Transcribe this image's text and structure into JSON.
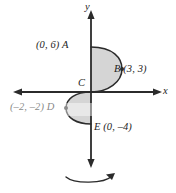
{
  "figure": {
    "title_text": "",
    "background_color": "#ffffff",
    "axis_color": "#2b2b2b",
    "curve_color": "#2b2b2b",
    "fill_color": "#d5d5d5"
  },
  "axes": {
    "x_label": "x",
    "y_label": "y",
    "origin_px": {
      "x": 91,
      "y": 92
    },
    "x_axis_extent_px": {
      "from": 13,
      "to": 162
    },
    "y_axis_extent_px": {
      "from": 10,
      "to": 168
    }
  },
  "points": [
    {
      "id": "A",
      "label": "(0, 6) A",
      "coords": "(0, 6)",
      "name": "A",
      "x": 0,
      "y": 6
    },
    {
      "id": "B",
      "label": "B (3, 3)",
      "coords": "(3, 3)",
      "name": "B",
      "x": 3,
      "y": 3
    },
    {
      "id": "C",
      "label": "C",
      "coords": "(0, 0)",
      "name": "C",
      "x": 0,
      "y": 0
    },
    {
      "id": "D",
      "label": "(–2, –2) D",
      "coords": "(–2, –2)",
      "name": "D",
      "x": -2,
      "y": -2
    },
    {
      "id": "E",
      "label": "E (0, –4)",
      "coords": "(0, –4)",
      "name": "E",
      "x": 0,
      "y": -4
    }
  ],
  "regions": [
    {
      "id": "upper-lobe",
      "name": "upper-shaded-region",
      "description": "Shaded region right of the y-axis from A(0,6) to C(0,0) through B(3,3)",
      "fill": "#d5d5d5"
    },
    {
      "id": "lower-lobe",
      "name": "lower-shaded-region",
      "description": "Shaded region left of the y-axis from C(0,0) to E(0,–4) through D(–2,–2)",
      "fill": "#d5d5d5"
    }
  ],
  "rotation_arrow": {
    "name": "rotation-about-y-axis-arrow",
    "description": "Curved arrow below the y-axis indicating revolution about the y-axis",
    "direction": "clockwise-to-right"
  }
}
